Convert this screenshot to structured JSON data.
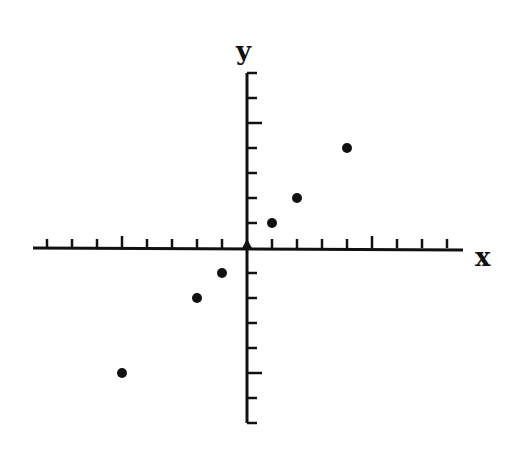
{
  "chart_data": {
    "type": "scatter",
    "title": "",
    "xlabel": "x",
    "ylabel": "y",
    "xlim": [
      -8,
      8
    ],
    "ylim": [
      -7,
      7
    ],
    "grid": false,
    "legend": null,
    "x_ticks": [
      -8,
      -7,
      -6,
      -5,
      -4,
      -3,
      -2,
      -1,
      1,
      2,
      3,
      4,
      5,
      6,
      7,
      8
    ],
    "x_major_ticks": [
      -5,
      5
    ],
    "y_ticks": [
      -7,
      -6,
      -5,
      -4,
      -3,
      -2,
      -1,
      1,
      2,
      3,
      4,
      5,
      6,
      7
    ],
    "y_major_ticks": [
      -5,
      5
    ],
    "tick_labels_shown": false,
    "series": [
      {
        "name": "points",
        "points": [
          {
            "x": -5,
            "y": -5
          },
          {
            "x": -2,
            "y": -2
          },
          {
            "x": -1,
            "y": -1
          },
          {
            "x": 0,
            "y": 0
          },
          {
            "x": 1,
            "y": 1
          },
          {
            "x": 2,
            "y": 2
          },
          {
            "x": 4,
            "y": 4
          }
        ]
      }
    ]
  },
  "style": {
    "ink_color": "#111111",
    "background": "#ffffff"
  }
}
